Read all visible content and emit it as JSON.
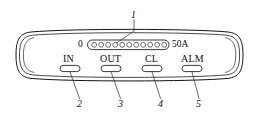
{
  "figure": {
    "kind": "technical-line-drawing",
    "background_color": "#ffffff",
    "line_color": "#141414"
  },
  "panel": {
    "name": "control-panel-body",
    "outline_style": "double-line-lens-shape"
  },
  "led_bar": {
    "name": "led-bar-graph",
    "segment_count": 11,
    "scale_min_label": "0",
    "scale_max_label": "50A"
  },
  "buttons": [
    {
      "label": "IN",
      "callout": "2"
    },
    {
      "label": "OUT",
      "callout": "3"
    },
    {
      "label": "CL",
      "callout": "4"
    },
    {
      "label": "ALM",
      "callout": "5"
    }
  ],
  "callouts": [
    {
      "number": "1",
      "target": "led-bar-graph"
    },
    {
      "number": "2",
      "target": "button-in"
    },
    {
      "number": "3",
      "target": "button-out"
    },
    {
      "number": "4",
      "target": "button-cl"
    },
    {
      "number": "5",
      "target": "button-alm"
    }
  ]
}
